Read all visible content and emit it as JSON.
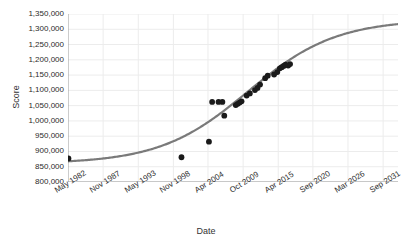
{
  "chart_data": {
    "type": "scatter",
    "title": "",
    "xlabel": "Date",
    "ylabel": "Score",
    "grid": true,
    "legend": false,
    "ylim": [
      800000,
      1350000
    ],
    "yticks": [
      "800,000",
      "850,000",
      "900,000",
      "950,000",
      "1,000,000",
      "1,050,000",
      "1,100,000",
      "1,150,000",
      "1,200,000",
      "1,250,000",
      "1,300,000",
      "1,350,000"
    ],
    "ytick_values": [
      800000,
      850000,
      900000,
      950000,
      1000000,
      1050000,
      1100000,
      1150000,
      1200000,
      1250000,
      1300000,
      1350000
    ],
    "xticks": [
      "May 1982",
      "Nov 1987",
      "May 1993",
      "Nov 1998",
      "Apr 2004",
      "Oct 2009",
      "Apr 2015",
      "Sep 2020",
      "Mar 2026",
      "Sep 2031"
    ],
    "xtick_values": [
      1982.33,
      1987.83,
      1993.33,
      1998.83,
      2004.25,
      2009.75,
      2015.25,
      2020.67,
      2026.17,
      2031.67
    ],
    "xlim": [
      1982.33,
      2034.0
    ],
    "series": [
      {
        "name": "Observations",
        "type": "scatter",
        "color": "#1a1a1a",
        "marker": "circle",
        "points": [
          {
            "x": 1982.4,
            "y": 877000
          },
          {
            "x": 2000.1,
            "y": 881000
          },
          {
            "x": 2004.4,
            "y": 932000
          },
          {
            "x": 2004.9,
            "y": 1062000
          },
          {
            "x": 2005.9,
            "y": 1062000
          },
          {
            "x": 2006.5,
            "y": 1062000
          },
          {
            "x": 2006.8,
            "y": 1017000
          },
          {
            "x": 2008.6,
            "y": 1052000
          },
          {
            "x": 2008.9,
            "y": 1056000
          },
          {
            "x": 2009.2,
            "y": 1060000
          },
          {
            "x": 2009.5,
            "y": 1064000
          },
          {
            "x": 2010.3,
            "y": 1083000
          },
          {
            "x": 2010.8,
            "y": 1090000
          },
          {
            "x": 2011.6,
            "y": 1101000
          },
          {
            "x": 2012.0,
            "y": 1108000
          },
          {
            "x": 2012.4,
            "y": 1119000
          },
          {
            "x": 2013.2,
            "y": 1140000
          },
          {
            "x": 2013.6,
            "y": 1148000
          },
          {
            "x": 2014.6,
            "y": 1152000
          },
          {
            "x": 2015.1,
            "y": 1160000
          },
          {
            "x": 2015.5,
            "y": 1172000
          },
          {
            "x": 2015.8,
            "y": 1176000
          },
          {
            "x": 2016.1,
            "y": 1180000
          },
          {
            "x": 2016.4,
            "y": 1184000
          },
          {
            "x": 2016.8,
            "y": 1181000
          },
          {
            "x": 2017.1,
            "y": 1186000
          }
        ]
      },
      {
        "name": "Fitted logistic trend",
        "type": "line",
        "color": "#7a7a7a",
        "curve": {
          "model": "logistic",
          "asymptote": 1332000,
          "baseline": 860000,
          "midpoint_x": 2010.5,
          "growth_rate": 0.145
        }
      }
    ]
  }
}
